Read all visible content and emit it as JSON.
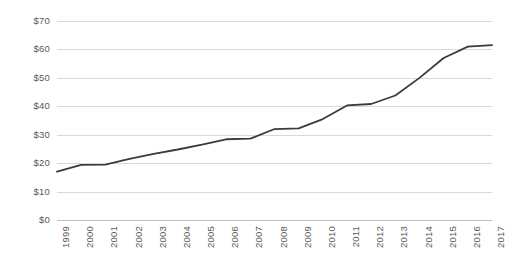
{
  "chart_data": {
    "type": "line",
    "title": "",
    "subtitle": "",
    "xlabel": "",
    "ylabel": "",
    "grid": true,
    "legend": false,
    "legend_position": "none",
    "line_color": "#3b3b3b",
    "gridline_color": "#d9d9d9",
    "axis_color": "#bfbfbf",
    "background_color": "#ffffff",
    "ylim": [
      0,
      70
    ],
    "ytick_values": [
      0,
      10,
      20,
      30,
      40,
      50,
      60,
      70
    ],
    "ytick_labels": [
      "$0",
      "$10",
      "$20",
      "$30",
      "$40",
      "$50",
      "$60",
      "$70"
    ],
    "categories": [
      "1999",
      "2000",
      "2001",
      "2002",
      "2003",
      "2004",
      "2005",
      "2006",
      "2007",
      "2008",
      "2009",
      "2010",
      "2011",
      "2012",
      "2013",
      "2014",
      "2015",
      "2016",
      "2017"
    ],
    "values": [
      17.0,
      19.4,
      19.5,
      21.5,
      23.3,
      24.8,
      26.5,
      28.4,
      28.6,
      32.0,
      32.2,
      35.5,
      40.3,
      40.8,
      43.8,
      50.0,
      57.0,
      61.0,
      61.5
    ],
    "series": [
      {
        "name": "",
        "color": "#3b3b3b",
        "values": [
          17.0,
          19.4,
          19.5,
          21.5,
          23.3,
          24.8,
          26.5,
          28.4,
          28.6,
          32.0,
          32.2,
          35.5,
          40.3,
          40.8,
          43.8,
          50.0,
          57.0,
          61.0,
          61.5
        ]
      }
    ],
    "annotations": []
  }
}
